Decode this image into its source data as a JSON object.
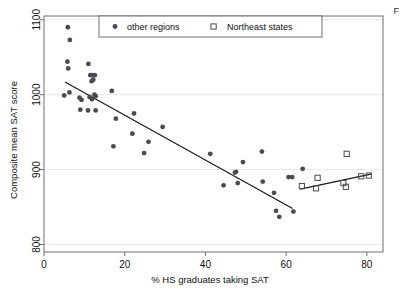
{
  "figure": {
    "background_color": "#ffffff",
    "plot_background_color": "#ffffff",
    "frame_color": "#6f6f6f",
    "grid_color": "#e6e6e6",
    "marker_color": "#4a4a52",
    "line_color": "#1a1a1a",
    "edge_artifact_text": "F"
  },
  "chart_data": {
    "type": "scatter",
    "title": "",
    "subtitle": "",
    "xlabel": "% HS graduates taking SAT",
    "ylabel": "Composite mean SAT score",
    "xlim": [
      0,
      84
    ],
    "ylim": [
      790,
      1105
    ],
    "xticks": [
      0,
      20,
      40,
      60,
      80
    ],
    "xtick_labels": [
      "0",
      "20",
      "40",
      "60",
      "80"
    ],
    "yticks": [
      800,
      900,
      1000,
      1100
    ],
    "ytick_labels": [
      "800",
      "900",
      "1000",
      "1100"
    ],
    "grid": "horizontal",
    "legend_position": "top-center-inside",
    "legend_entries": [
      {
        "label": "other regions",
        "marker": "filled-circle",
        "color": "#4a4a52"
      },
      {
        "label": "Northeast states",
        "marker": "open-square",
        "color": "#4a4a52"
      }
    ],
    "series": [
      {
        "name": "other regions",
        "marker": "filled-circle",
        "color": "#4a4a52",
        "points": [
          [
            5.9,
            1090
          ],
          [
            6.4,
            1073
          ],
          [
            5.8,
            1044
          ],
          [
            11.0,
            1041
          ],
          [
            6.0,
            1035
          ],
          [
            11.5,
            1026
          ],
          [
            12.1,
            1026
          ],
          [
            12.6,
            1026
          ],
          [
            12.2,
            1020
          ],
          [
            11.8,
            1018
          ],
          [
            5.0,
            999
          ],
          [
            6.3,
            1003
          ],
          [
            8.8,
            996
          ],
          [
            9.3,
            993
          ],
          [
            11.3,
            997
          ],
          [
            11.9,
            994
          ],
          [
            12.5,
            1000
          ],
          [
            12.8,
            998
          ],
          [
            16.8,
            1005
          ],
          [
            9.0,
            980
          ],
          [
            10.9,
            979
          ],
          [
            12.8,
            979
          ],
          [
            17.8,
            968
          ],
          [
            22.3,
            975
          ],
          [
            21.9,
            948
          ],
          [
            17.2,
            931
          ],
          [
            25.9,
            937
          ],
          [
            24.8,
            922
          ],
          [
            29.4,
            957
          ],
          [
            41.2,
            921
          ],
          [
            44.5,
            879
          ],
          [
            47.6,
            897
          ],
          [
            47.3,
            896
          ],
          [
            48.0,
            882
          ],
          [
            49.3,
            910
          ],
          [
            54.0,
            924
          ],
          [
            54.2,
            884
          ],
          [
            57.0,
            869
          ],
          [
            57.5,
            845
          ],
          [
            58.3,
            837
          ],
          [
            60.6,
            890
          ],
          [
            61.5,
            890
          ],
          [
            61.8,
            844
          ],
          [
            64.1,
            901
          ]
        ]
      },
      {
        "name": "Northeast states",
        "marker": "open-square",
        "color": "#4a4a52",
        "points": [
          [
            63.9,
            878
          ],
          [
            67.4,
            875
          ],
          [
            67.8,
            889
          ],
          [
            74.2,
            882
          ],
          [
            74.8,
            877
          ],
          [
            75.0,
            921
          ],
          [
            78.6,
            891
          ],
          [
            80.5,
            892
          ]
        ]
      }
    ],
    "fit_lines": [
      {
        "name": "other-regions-fit",
        "x_start": 5.2,
        "y_start": 1017,
        "x_end": 61.6,
        "y_end": 848
      },
      {
        "name": "northeast-states-fit",
        "x_start": 63.5,
        "y_start": 874,
        "x_end": 81.0,
        "y_end": 894
      }
    ]
  }
}
